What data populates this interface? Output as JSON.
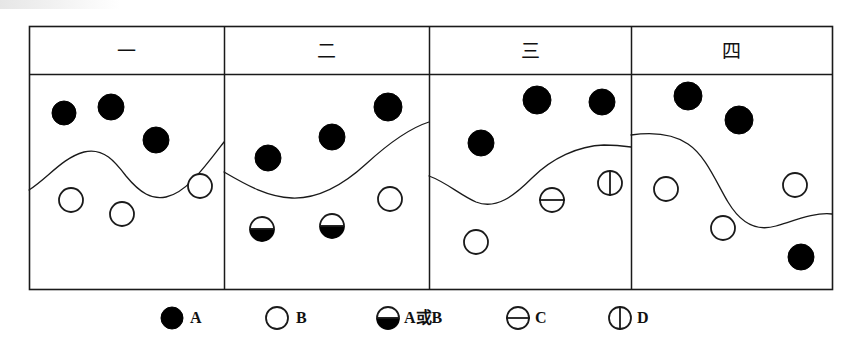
{
  "figure": {
    "title": "",
    "frame": {
      "x": 29,
      "y": 26,
      "width": 803,
      "height": 263,
      "header_height": 48,
      "stroke": "#1a1a1a"
    },
    "colors": {
      "ink": "#111111",
      "fill_dark": "#000000",
      "fill_light": "#ffffff",
      "line": "#1a1a1a"
    },
    "panels": [
      {
        "id": "panel-1",
        "header_label": "一",
        "x": 29,
        "width": 195,
        "boundary_path": "M29,190 C48,178 62,158 84,152 C104,147 116,163 126,176 C140,193 152,200 166,197 C186,193 204,168 224,142",
        "symbols": [
          {
            "name": "symbol-A",
            "type": "A",
            "cx": 64,
            "cy": 113,
            "r": 12
          },
          {
            "name": "symbol-A",
            "type": "A",
            "cx": 111,
            "cy": 107,
            "r": 13
          },
          {
            "name": "symbol-A",
            "type": "A",
            "cx": 156,
            "cy": 140,
            "r": 13
          },
          {
            "name": "symbol-B",
            "type": "B",
            "cx": 71,
            "cy": 200,
            "r": 12
          },
          {
            "name": "symbol-B",
            "type": "B",
            "cx": 122,
            "cy": 214,
            "r": 12
          },
          {
            "name": "symbol-B",
            "type": "B",
            "cx": 200,
            "cy": 186,
            "r": 12
          }
        ]
      },
      {
        "id": "panel-2",
        "header_label": "二",
        "x": 224,
        "width": 205,
        "boundary_path": "M224,172 C248,186 268,197 292,198 C318,199 342,186 366,164 C390,142 410,128 429,122",
        "symbols": [
          {
            "name": "symbol-A",
            "type": "A",
            "cx": 268,
            "cy": 158,
            "r": 13
          },
          {
            "name": "symbol-A",
            "type": "A",
            "cx": 332,
            "cy": 137,
            "r": 13
          },
          {
            "name": "symbol-A",
            "type": "A",
            "cx": 388,
            "cy": 107,
            "r": 14
          },
          {
            "name": "symbol-AB",
            "type": "AB",
            "cx": 262,
            "cy": 229,
            "r": 12
          },
          {
            "name": "symbol-AB",
            "type": "AB",
            "cx": 332,
            "cy": 226,
            "r": 12
          },
          {
            "name": "symbol-B",
            "type": "B",
            "cx": 390,
            "cy": 199,
            "r": 12
          }
        ]
      },
      {
        "id": "panel-3",
        "header_label": "三",
        "x": 429,
        "width": 202,
        "boundary_path": "M429,176 C446,182 460,195 476,202 C496,210 514,196 532,178 C552,158 578,146 604,145 C616,145 624,146 631,147",
        "symbols": [
          {
            "name": "symbol-A",
            "type": "A",
            "cx": 481,
            "cy": 143,
            "r": 13
          },
          {
            "name": "symbol-A",
            "type": "A",
            "cx": 537,
            "cy": 100,
            "r": 14
          },
          {
            "name": "symbol-A",
            "type": "A",
            "cx": 602,
            "cy": 102,
            "r": 13
          },
          {
            "name": "symbol-B",
            "type": "B",
            "cx": 476,
            "cy": 242,
            "r": 12
          },
          {
            "name": "symbol-C",
            "type": "C",
            "cx": 552,
            "cy": 200,
            "r": 12
          },
          {
            "name": "symbol-D",
            "type": "D",
            "cx": 610,
            "cy": 183,
            "r": 12
          }
        ]
      },
      {
        "id": "panel-4",
        "header_label": "四",
        "x": 631,
        "width": 201,
        "boundary_path": "M631,135 C652,132 672,133 688,144 C706,156 716,182 728,202 C740,222 756,232 776,226 C796,220 816,212 832,214",
        "symbols": [
          {
            "name": "symbol-A",
            "type": "A",
            "cx": 688,
            "cy": 96,
            "r": 14
          },
          {
            "name": "symbol-A",
            "type": "A",
            "cx": 739,
            "cy": 120,
            "r": 14
          },
          {
            "name": "symbol-B",
            "type": "B",
            "cx": 666,
            "cy": 189,
            "r": 12
          },
          {
            "name": "symbol-B",
            "type": "B",
            "cx": 723,
            "cy": 228,
            "r": 12
          },
          {
            "name": "symbol-B",
            "type": "B",
            "cx": 795,
            "cy": 185,
            "r": 12
          },
          {
            "name": "symbol-A",
            "type": "A",
            "cx": 801,
            "cy": 257,
            "r": 13
          }
        ]
      }
    ],
    "legend": {
      "y": 318,
      "items": [
        {
          "name": "legend-item-a",
          "type": "A",
          "label": "A",
          "cx": 172,
          "cy": 318,
          "r": 11,
          "label_x": 190
        },
        {
          "name": "legend-item-b",
          "type": "B",
          "label": "B",
          "cx": 277,
          "cy": 318,
          "r": 11,
          "label_x": 296
        },
        {
          "name": "legend-item-ab",
          "type": "AB",
          "label": "A或B",
          "cx": 388,
          "cy": 318,
          "r": 11,
          "label_x": 404
        },
        {
          "name": "legend-item-c",
          "type": "C",
          "label": "C",
          "cx": 518,
          "cy": 318,
          "r": 11,
          "label_x": 535
        },
        {
          "name": "legend-item-d",
          "type": "D",
          "label": "D",
          "cx": 620,
          "cy": 318,
          "r": 11,
          "label_x": 637
        }
      ]
    }
  }
}
